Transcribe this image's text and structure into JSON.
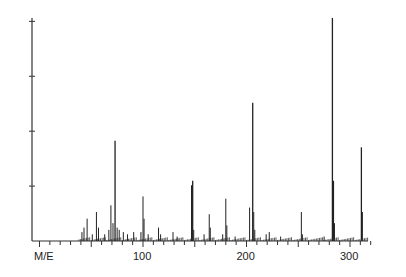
{
  "chart_data": {
    "type": "bar",
    "title": "",
    "xlabel": "M/E",
    "ylabel": "",
    "xlim": [
      0,
      320
    ],
    "ylim": [
      0,
      100
    ],
    "x_tick_labels": [
      "100",
      "200",
      "300"
    ],
    "x_tick_label_values": [
      100,
      200,
      300
    ],
    "minor_tick_step": 10,
    "y_ticks": [
      25,
      50,
      75,
      100
    ],
    "grid": false,
    "legend": null,
    "peaks": [
      {
        "mz": 41,
        "intensity": 4
      },
      {
        "mz": 43,
        "intensity": 6
      },
      {
        "mz": 46,
        "intensity": 10
      },
      {
        "mz": 51,
        "intensity": 3
      },
      {
        "mz": 55,
        "intensity": 13
      },
      {
        "mz": 57,
        "intensity": 6
      },
      {
        "mz": 63,
        "intensity": 3
      },
      {
        "mz": 67,
        "intensity": 5
      },
      {
        "mz": 69,
        "intensity": 16
      },
      {
        "mz": 71,
        "intensity": 8
      },
      {
        "mz": 73,
        "intensity": 45
      },
      {
        "mz": 75,
        "intensity": 6
      },
      {
        "mz": 77,
        "intensity": 5
      },
      {
        "mz": 81,
        "intensity": 4
      },
      {
        "mz": 85,
        "intensity": 3
      },
      {
        "mz": 91,
        "intensity": 4
      },
      {
        "mz": 98,
        "intensity": 4
      },
      {
        "mz": 100,
        "intensity": 20
      },
      {
        "mz": 101,
        "intensity": 10
      },
      {
        "mz": 105,
        "intensity": 3
      },
      {
        "mz": 115,
        "intensity": 6
      },
      {
        "mz": 117,
        "intensity": 3
      },
      {
        "mz": 129,
        "intensity": 4
      },
      {
        "mz": 133,
        "intensity": 2
      },
      {
        "mz": 147,
        "intensity": 25
      },
      {
        "mz": 148,
        "intensity": 27
      },
      {
        "mz": 149,
        "intensity": 5
      },
      {
        "mz": 159,
        "intensity": 3
      },
      {
        "mz": 164,
        "intensity": 12
      },
      {
        "mz": 165,
        "intensity": 6
      },
      {
        "mz": 177,
        "intensity": 3
      },
      {
        "mz": 180,
        "intensity": 19
      },
      {
        "mz": 181,
        "intensity": 7
      },
      {
        "mz": 189,
        "intensity": 2
      },
      {
        "mz": 203,
        "intensity": 15
      },
      {
        "mz": 206,
        "intensity": 62
      },
      {
        "mz": 207,
        "intensity": 13
      },
      {
        "mz": 208,
        "intensity": 5
      },
      {
        "mz": 219,
        "intensity": 3
      },
      {
        "mz": 222,
        "intensity": 4
      },
      {
        "mz": 233,
        "intensity": 2
      },
      {
        "mz": 253,
        "intensity": 13
      },
      {
        "mz": 254,
        "intensity": 3
      },
      {
        "mz": 275,
        "intensity": 2
      },
      {
        "mz": 283,
        "intensity": 100
      },
      {
        "mz": 284,
        "intensity": 27
      },
      {
        "mz": 285,
        "intensity": 8
      },
      {
        "mz": 311,
        "intensity": 42
      },
      {
        "mz": 312,
        "intensity": 13
      }
    ]
  },
  "axis": {
    "x_label": "M/E"
  }
}
